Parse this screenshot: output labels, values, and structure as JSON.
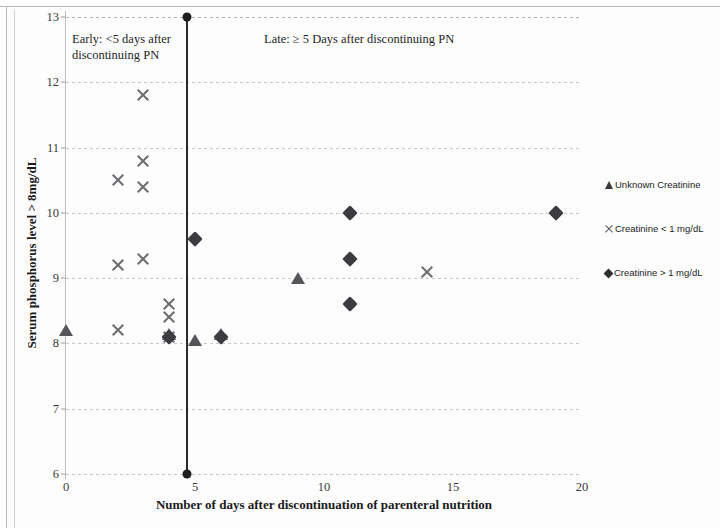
{
  "chart_data": {
    "type": "scatter",
    "title": "",
    "xlabel": "Number of days after discontinuation of parenteral nutrition",
    "ylabel": "Serum phosphorus level > 8mg/dL",
    "xlim": [
      0,
      20
    ],
    "ylim": [
      6,
      13
    ],
    "xticks": [
      "0",
      "5",
      "10",
      "15",
      "20"
    ],
    "xtick_values": [
      0,
      5,
      10,
      15,
      20
    ],
    "yticks": [
      "6",
      "7",
      "8",
      "9",
      "10",
      "11",
      "12",
      "13"
    ],
    "ytick_values": [
      6,
      7,
      8,
      9,
      10,
      11,
      12,
      13
    ],
    "grid": true,
    "legend_position": "right",
    "series": [
      {
        "name": "Unknown Creatinine",
        "marker": "triangle",
        "color": "#55555a",
        "points": [
          {
            "x": 0,
            "y": 8.2
          },
          {
            "x": 4,
            "y": 8.15
          },
          {
            "x": 5,
            "y": 8.05
          },
          {
            "x": 6,
            "y": 8.15
          },
          {
            "x": 9,
            "y": 9.0
          }
        ]
      },
      {
        "name": "Creatinine < 1 mg/dL",
        "marker": "cross",
        "color": "#6d6d72",
        "points": [
          {
            "x": 2,
            "y": 8.2
          },
          {
            "x": 2,
            "y": 9.2
          },
          {
            "x": 2,
            "y": 10.5
          },
          {
            "x": 3,
            "y": 9.3
          },
          {
            "x": 3,
            "y": 10.4
          },
          {
            "x": 3,
            "y": 10.8
          },
          {
            "x": 3,
            "y": 11.8
          },
          {
            "x": 4,
            "y": 8.1
          },
          {
            "x": 4,
            "y": 8.4
          },
          {
            "x": 4,
            "y": 8.6
          },
          {
            "x": 14,
            "y": 9.1
          }
        ]
      },
      {
        "name": "Creatinine > 1 mg/dL",
        "marker": "diamond",
        "color": "#3b3b40",
        "points": [
          {
            "x": 4,
            "y": 8.1
          },
          {
            "x": 5,
            "y": 9.6
          },
          {
            "x": 6,
            "y": 8.1
          },
          {
            "x": 11,
            "y": 8.6
          },
          {
            "x": 11,
            "y": 9.3
          },
          {
            "x": 11,
            "y": 10.0
          },
          {
            "x": 19,
            "y": 10.0
          }
        ]
      }
    ],
    "annotations": [
      {
        "id": "early",
        "text": "Early: <5 days after discontinuing PN"
      },
      {
        "id": "late",
        "text": "Late: ≥ 5 Days after discontinuing PN"
      }
    ],
    "divider": {
      "x": 4.65,
      "label": "early-late-divider",
      "color": "#2b2b2b"
    }
  },
  "legend": {
    "items": [
      {
        "label": "Unknown Creatinine",
        "marker": "triangle"
      },
      {
        "label": "Creatinine < 1 mg/dL",
        "marker": "cross"
      },
      {
        "label": "Creatinine > 1 mg/dL",
        "marker": "diamond"
      }
    ]
  }
}
